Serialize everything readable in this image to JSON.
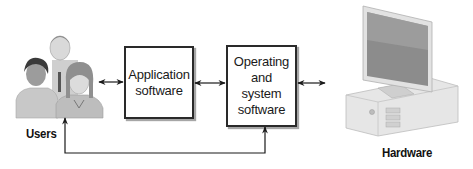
{
  "diagram": {
    "type": "flow",
    "nodes": [
      {
        "id": "users",
        "label": "Users",
        "kind": "image-people"
      },
      {
        "id": "application",
        "label": "Application\nsoftware",
        "kind": "box"
      },
      {
        "id": "os",
        "label": "Operating\nand\nsystem\nsoftware",
        "kind": "box"
      },
      {
        "id": "hardware",
        "label": "Hardware",
        "kind": "image-computer"
      }
    ],
    "edges": [
      {
        "from": "users",
        "to": "application",
        "direction": "both"
      },
      {
        "from": "application",
        "to": "os",
        "direction": "both"
      },
      {
        "from": "os",
        "to": "hardware",
        "direction": "both"
      },
      {
        "from": "os",
        "to": "users",
        "direction": "both",
        "route": "below"
      }
    ]
  },
  "labels": {
    "users": "Users",
    "application": "Application\nsoftware",
    "os": "Operating\nand\nsystem\nsoftware",
    "hardware": "Hardware"
  },
  "colors": {
    "line": "#2a2a2a",
    "box_border": "#2a2a2a",
    "background": "#ffffff"
  }
}
